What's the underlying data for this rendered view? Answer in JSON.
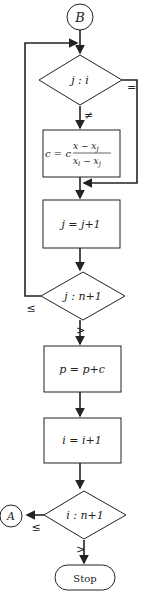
{
  "connectors": {
    "start": "B",
    "exit": "A"
  },
  "decisions": [
    {
      "id": "d1",
      "label": "j : i",
      "branches": {
        "equal": "=",
        "not_equal": "≠"
      }
    },
    {
      "id": "d2",
      "label": "j : n+1",
      "branches": {
        "le": "≤",
        "gt": ">"
      }
    },
    {
      "id": "d3",
      "label": "i : n+1",
      "branches": {
        "le": "≤",
        "gt": ">"
      }
    }
  ],
  "processes": [
    {
      "id": "p1",
      "label_lhs": "c = c",
      "num": "x − x",
      "num_sub": "j",
      "den": "x",
      "den_sub1": "i",
      "den_mid": " − x",
      "den_sub2": "j"
    },
    {
      "id": "p2",
      "label": "j = j+1"
    },
    {
      "id": "p3",
      "label": "p = p+c"
    },
    {
      "id": "p4",
      "label": "i = i+1"
    }
  ],
  "terminal": {
    "label": "Stop"
  },
  "colors": {
    "line": "#222222",
    "background": "#ffffff"
  }
}
